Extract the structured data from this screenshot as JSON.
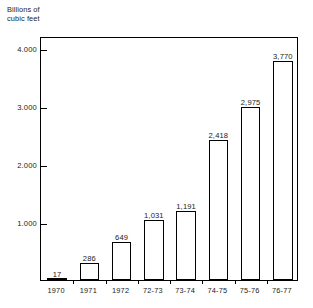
{
  "chart_data": {
    "type": "bar",
    "title": "",
    "subtitle": "",
    "ylabel": "Billions of\ncubic feet",
    "xlabel": "",
    "categories": [
      "1970",
      "1971",
      "1972",
      "72-73",
      "73-74",
      "74-75",
      "75-76",
      "76-77"
    ],
    "values": [
      17,
      286,
      649,
      1031,
      1191,
      2418,
      2975,
      3770
    ],
    "value_labels": [
      "17",
      "286",
      "649",
      "1,031",
      "1,191",
      "2,418",
      "2,975",
      "3,770"
    ],
    "ylim": [
      0,
      4200
    ],
    "ytick_values": [
      1000,
      2000,
      3000,
      4000
    ],
    "ytick_labels": [
      "1.000",
      "2.000",
      "3.000",
      "4.000"
    ],
    "grid": false,
    "legend": null,
    "series": [
      {
        "name": "",
        "values": [
          17,
          286,
          649,
          1031,
          1191,
          2418,
          2975,
          3770
        ]
      }
    ],
    "colors": {
      "bar_fill": "#ffffff",
      "bar_stroke": "#000000",
      "axis": "#000000",
      "text": "#222222",
      "background": "#ffffff"
    }
  }
}
